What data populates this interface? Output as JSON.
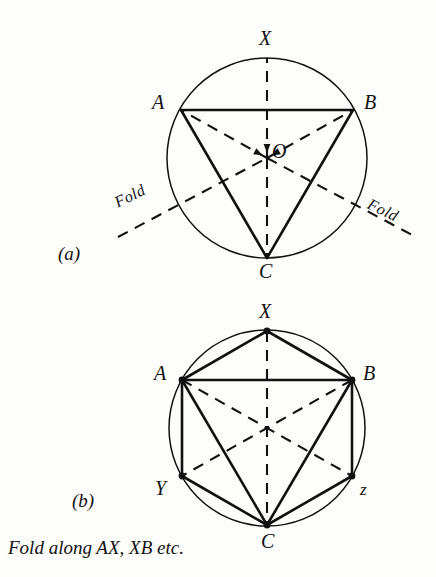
{
  "figure": {
    "background_color": "#fdfdfc",
    "ink_color": "#111111",
    "panels": [
      {
        "key": "a",
        "label": "(a)",
        "label_pos": [
          58,
          244
        ],
        "circle": {
          "cx": 267,
          "cy": 158,
          "r": 100
        },
        "vertices": [
          {
            "id": "X",
            "label": "X",
            "x": 267,
            "y": 58,
            "label_x": 259,
            "label_y": 28,
            "dot": false
          },
          {
            "id": "A",
            "label": "A",
            "x": 181,
            "y": 110,
            "label_x": 152,
            "label_y": 92,
            "dot": false
          },
          {
            "id": "B",
            "label": "B",
            "x": 353,
            "y": 110,
            "label_x": 364,
            "label_y": 92,
            "dot": false
          },
          {
            "id": "C",
            "label": "C",
            "x": 267,
            "y": 258,
            "label_x": 259,
            "label_y": 261,
            "dot": false
          },
          {
            "id": "O",
            "label": "O",
            "x": 267,
            "y": 158,
            "label_x": 272,
            "label_y": 141,
            "dot": false
          }
        ],
        "solid_edges": [
          [
            "A",
            "B"
          ],
          [
            "A",
            "C"
          ],
          [
            "B",
            "C"
          ]
        ],
        "dashed_edges": [
          [
            "O",
            "X"
          ],
          [
            "O",
            "A"
          ],
          [
            "O",
            "B"
          ],
          [
            "O",
            "C"
          ]
        ],
        "fold_lines": [
          {
            "from": [
              118,
              237
            ],
            "to": [
              267,
              158
            ]
          },
          {
            "from": [
              267,
              158
            ],
            "to": [
              416,
              237
            ]
          }
        ],
        "fold_labels": [
          {
            "text": "Fold",
            "x": 112,
            "y": 196,
            "rotate": -26
          },
          {
            "text": "Fold",
            "x": 372,
            "y": 196,
            "rotate": 26
          }
        ]
      },
      {
        "key": "b",
        "label": "(b)",
        "label_pos": [
          72,
          491
        ],
        "circle": {
          "cx": 267,
          "cy": 428,
          "r": 98
        },
        "vertices": [
          {
            "id": "X",
            "label": "X",
            "x": 267,
            "y": 331,
            "label_x": 259,
            "label_y": 301,
            "dot": true
          },
          {
            "id": "A",
            "label": "A",
            "x": 182,
            "y": 380,
            "label_x": 154,
            "label_y": 363,
            "dot": true
          },
          {
            "id": "B",
            "label": "B",
            "x": 352,
            "y": 380,
            "label_x": 363,
            "label_y": 363,
            "dot": true
          },
          {
            "id": "Y",
            "label": "Y",
            "x": 182,
            "y": 476,
            "label_x": 155,
            "label_y": 478,
            "dot": true
          },
          {
            "id": "z",
            "label": "z",
            "x": 352,
            "y": 476,
            "label_x": 360,
            "label_y": 481,
            "dot": true
          },
          {
            "id": "C",
            "label": "C",
            "x": 267,
            "y": 525,
            "label_x": 261,
            "label_y": 531,
            "dot": true
          }
        ],
        "solid_edges": [
          [
            "A",
            "X"
          ],
          [
            "X",
            "B"
          ],
          [
            "B",
            "z"
          ],
          [
            "z",
            "C"
          ],
          [
            "C",
            "Y"
          ],
          [
            "Y",
            "A"
          ],
          [
            "A",
            "B"
          ],
          [
            "A",
            "C"
          ],
          [
            "B",
            "C"
          ]
        ],
        "dashed_edges": [
          [
            "X",
            "C"
          ],
          [
            "A",
            "z"
          ],
          [
            "B",
            "Y"
          ]
        ]
      }
    ],
    "caption": {
      "text": "Fold along AX, XB etc.",
      "x": 8,
      "y": 538
    }
  }
}
